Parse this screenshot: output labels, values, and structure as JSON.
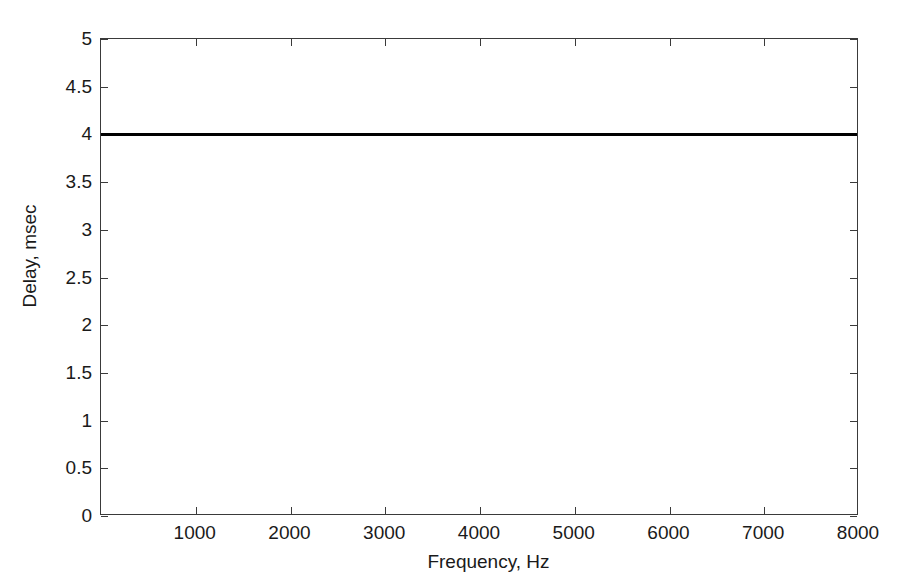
{
  "figure": {
    "background_color": "#ffffff",
    "axes_color": "#3a3a3a",
    "text_color": "#1a1a1a"
  },
  "chart_data": {
    "type": "line",
    "title": "",
    "subtitle": "",
    "xlabel": "Frequency, Hz",
    "ylabel": "Delay, msec",
    "xlim": [
      0,
      8000
    ],
    "ylim": [
      0,
      5
    ],
    "grid": false,
    "legend": null,
    "legend_position": "none",
    "xticks": [
      0,
      1000,
      2000,
      3000,
      4000,
      5000,
      6000,
      7000,
      8000
    ],
    "xticklabels": [
      "",
      "1000",
      "2000",
      "3000",
      "4000",
      "5000",
      "6000",
      "7000",
      "8000"
    ],
    "yticks": [
      0,
      0.5,
      1,
      1.5,
      2,
      2.5,
      3,
      3.5,
      4,
      4.5,
      5
    ],
    "yticklabels": [
      "0",
      "0.5",
      "1",
      "1.5",
      "2",
      "2.5",
      "3",
      "3.5",
      "4",
      "4.5",
      "5"
    ],
    "series": [
      {
        "name": "Group delay",
        "color": "#000000",
        "linewidth": 3,
        "x": [
          0,
          500,
          1000,
          1500,
          2000,
          2500,
          3000,
          3500,
          4000,
          4500,
          5000,
          5500,
          6000,
          6500,
          7000,
          7500,
          8000
        ],
        "values": [
          4,
          4,
          4,
          4,
          4,
          4,
          4,
          4,
          4,
          4,
          4,
          4,
          4,
          4,
          4,
          4,
          4
        ]
      }
    ],
    "annotations": []
  }
}
